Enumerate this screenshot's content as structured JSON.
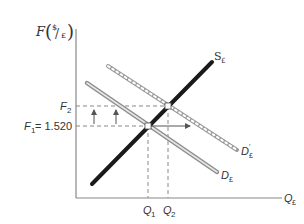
{
  "diagram": {
    "y_axis": {
      "label_var": "F",
      "label_unit_num": "$",
      "label_unit_den": "£"
    },
    "x_axis": {
      "label_var": "Q",
      "label_sub": "£"
    },
    "curves": [
      {
        "id": "S",
        "label": "S",
        "sub": "£",
        "style": "thick-black"
      },
      {
        "id": "D",
        "label": "D",
        "sub": "£",
        "style": "double-gray"
      },
      {
        "id": "D_prime",
        "label": "D",
        "sub": "£",
        "prime": "′",
        "style": "chain"
      }
    ],
    "prices": [
      {
        "id": "F2",
        "label": "F",
        "sub": "2",
        "suffix": ""
      },
      {
        "id": "F1",
        "label": "F",
        "sub": "1",
        "suffix": " = 1.520"
      }
    ],
    "quantities": [
      {
        "id": "Q1",
        "label": "Q",
        "sub": "1"
      },
      {
        "id": "Q2",
        "label": "Q",
        "sub": "2"
      }
    ],
    "colors": {
      "axis": "#888888",
      "supply": "#1a1a1a",
      "demand": "#9a9a9a",
      "dash": "#888888"
    }
  }
}
